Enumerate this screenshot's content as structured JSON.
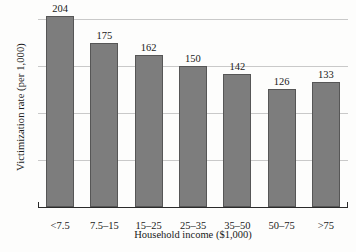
{
  "chart_data": {
    "type": "bar",
    "title": "",
    "xlabel": "Household income ($1,000)",
    "ylabel": "Victimization rate (per 1,000)",
    "categories": [
      "<7.5",
      "7.5–15",
      "15–25",
      "25–35",
      "35–50",
      "50–75",
      ">75"
    ],
    "values": [
      204,
      175,
      162,
      150,
      142,
      126,
      133
    ],
    "value_labels": [
      "204",
      "175",
      "162",
      "150",
      "142",
      "126",
      "133"
    ],
    "ylim": [
      0,
      210
    ],
    "yticks": [
      0,
      50,
      100,
      150,
      200
    ],
    "ytick_labels": [],
    "grid": true,
    "grid_axis": "y",
    "legend": false,
    "bar_color": "#7d7d7d",
    "bar_edge_color": "#565656",
    "grid_color": "#c9c9c9",
    "axis_color": "#2a2a2a",
    "background": "#fdfdfc",
    "text_color": "#1a1a1a"
  }
}
